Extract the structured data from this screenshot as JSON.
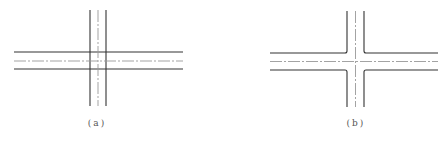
{
  "figures": [
    {
      "id": "a",
      "label": "(a)",
      "description": "Two roads crossing with all edge lines continuing through the intersection"
    },
    {
      "id": "b",
      "label": "(b)",
      "description": "Two roads crossing with edge lines stopping at the intersection (open junction)"
    }
  ],
  "colors": {
    "line": "#333333",
    "centerline": "#999999",
    "background": "#ffffff"
  }
}
